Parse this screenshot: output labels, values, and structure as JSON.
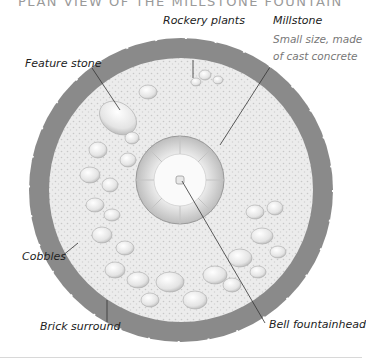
{
  "title": "PLAN VIEW OF THE MILLSTONE FOUNTAIN",
  "labels": {
    "rockery_plants": "Rockery plants",
    "millstone": "Millstone",
    "millstone_note_1": "Small size, made",
    "millstone_note_2": "of cast concrete",
    "feature_stone": "Feature stone",
    "cobbles": "Cobbles",
    "brick_surround": "Brick surround",
    "bell_fountainhead": "Bell fountainhead"
  },
  "colors": {
    "brick": "#6e6e6e",
    "gravel": "#e6e6e6",
    "cobble": "#f2f2f2",
    "leader": "#333333"
  }
}
